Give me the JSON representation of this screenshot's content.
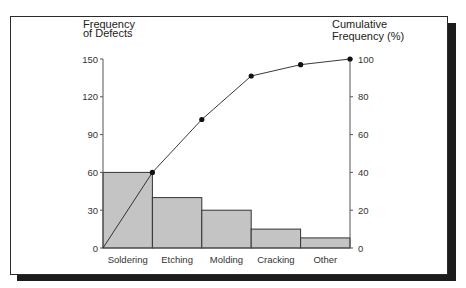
{
  "chart_data": {
    "type": "bar",
    "subtype": "pareto",
    "title": "",
    "categories": [
      "Soldering",
      "Etching",
      "Molding",
      "Cracking",
      "Other"
    ],
    "series": [
      {
        "name": "Frequency of Defects",
        "type": "bar",
        "axis": "left",
        "values": [
          60,
          40,
          30,
          15,
          8
        ]
      },
      {
        "name": "Cumulative Frequency (%)",
        "type": "line",
        "axis": "right",
        "values": [
          40,
          68,
          91,
          97,
          100
        ]
      }
    ],
    "ylabel": "Frequency of Defects",
    "ylabel_right": "Cumulative Frequency (%)",
    "xlabel": "",
    "ylim": [
      0,
      150
    ],
    "ylim_right": [
      0,
      100
    ],
    "yticks": [
      0,
      30,
      60,
      90,
      120,
      150
    ],
    "yticks_right": [
      0,
      20,
      40,
      60,
      80,
      100
    ],
    "grid": false,
    "legend": "none",
    "colors": {
      "bar_fill": "#c4c4c4",
      "bar_edge": "#333333",
      "line": "#222222",
      "marker": "#111111"
    }
  },
  "labels": {
    "left_axis_line1": "Frequency",
    "left_axis_line2": "of Defects",
    "right_axis_line1": "Cumulative",
    "right_axis_line2": "Frequency (%)"
  }
}
